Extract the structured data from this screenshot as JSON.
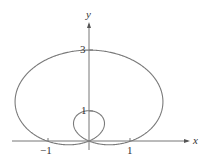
{
  "chart_data": {
    "type": "line",
    "title": "",
    "xlabel": "x",
    "ylabel": "y",
    "x_ticks": [
      {
        "value": -1,
        "label": "−1"
      },
      {
        "value": 1,
        "label": "1"
      }
    ],
    "y_ticks": [
      {
        "value": 1,
        "label": "1"
      },
      {
        "value": 3,
        "label": "3"
      }
    ],
    "xlim": [
      -2,
      2.6
    ],
    "ylim": [
      -0.35,
      4.3
    ],
    "grid": false,
    "series": [
      {
        "name": "r = 1 + 2 sin θ",
        "equation": "r = 1 + 2*sin(theta)",
        "color": "#777777"
      }
    ],
    "key_points": [
      {
        "x": 0,
        "y": 3,
        "note": "top of outer loop"
      },
      {
        "x": 0,
        "y": 1,
        "note": "top of inner loop"
      },
      {
        "x": 0,
        "y": 0,
        "note": "pole / self-intersection"
      },
      {
        "x": -1,
        "y": 0
      },
      {
        "x": 1,
        "y": 0
      }
    ]
  },
  "labels": {
    "x_axis": "x",
    "y_axis": "y",
    "tick_neg1": "−1",
    "tick_pos1": "1",
    "tick_y1": "1",
    "tick_y3": "3"
  }
}
